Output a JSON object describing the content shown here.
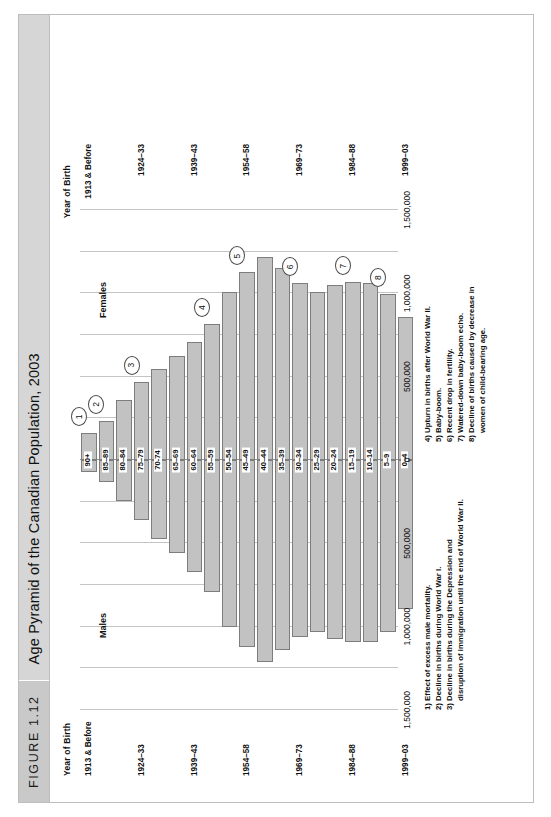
{
  "figure": {
    "number_label": "FIGURE 1.12",
    "title": "Age Pyramid of the Canadian Population, 2003",
    "year_of_birth_label_left": "Year of Birth",
    "year_of_birth_label_right": "Year of Birth",
    "males_caption": "Males",
    "females_caption": "Females",
    "source": "Source: Based on data in Statistics Canada, CANSIM Table 051-0001 and the periodization in Catalogue 91-209-XPE."
  },
  "axis": {
    "ticks_left": [
      "1,500,000",
      "1,000,000",
      "500,000",
      "0"
    ],
    "ticks_right": [
      "500,000",
      "1,000,000",
      "1,500,000"
    ],
    "all_ticks": [
      "1,500,000",
      "1,000,000",
      "500,000",
      "0",
      "500,000",
      "1,000,000",
      "1,500,000"
    ]
  },
  "notes_left": [
    "1) Effect of excess male mortality.",
    "2) Decline in births during World War I.",
    "3) Decline in births during the Depression and",
    "disruption of immigration until the end of World War II."
  ],
  "notes_right": [
    "4) Upturn in births after World War II.",
    "5) Baby-boom.",
    "6) Recent drop in fertility.",
    "7) Watered-down baby-boom echo.",
    "8) Decline of births caused by decrease in",
    "women of child-bearing age."
  ],
  "callouts": [
    {
      "n": "1",
      "row": 0
    },
    {
      "n": "2",
      "row": 1
    },
    {
      "n": "3",
      "row": 3
    },
    {
      "n": "4",
      "row": 7
    },
    {
      "n": "5",
      "row": 9
    },
    {
      "n": "6",
      "row": 12
    },
    {
      "n": "7",
      "row": 15
    },
    {
      "n": "8",
      "row": 17
    }
  ],
  "colors": {
    "bar_fill": "#c2c2c2",
    "bar_stroke": "#7d7d7d",
    "grid": "#c4c4c4",
    "axis": "#8e8e8e",
    "title_bar": "#d6d6d6",
    "fig_num_bar": "#c9c9c9"
  },
  "chart_data": {
    "type": "bar",
    "title": "Age Pyramid of the Canadian Population, 2003",
    "subtype": "population-pyramid",
    "xlabel": "",
    "ylabel": "Year of Birth",
    "xlim": [
      -1500000,
      1500000
    ],
    "grid": true,
    "legend": [
      "Males",
      "Females"
    ],
    "legend_position": "inside-top",
    "categories": [
      "90+",
      "85–89",
      "80–84",
      "75–79",
      "70-74",
      "65–69",
      "60–64",
      "55–59",
      "50–54",
      "45–49",
      "40–44",
      "35–39",
      "30–34",
      "25–29",
      "20–24",
      "15–19",
      "10–14",
      "5–9",
      "0–4"
    ],
    "year_of_birth": [
      "1913 & Before",
      "",
      "",
      "1924–33",
      "",
      "",
      "1939–43",
      "",
      "",
      "1954–58",
      "",
      "",
      "1969–73",
      "",
      "",
      "1984–88",
      "",
      "",
      "1999–03"
    ],
    "series": [
      {
        "name": "Males",
        "values": [
          75000,
          135000,
          245000,
          360000,
          475000,
          560000,
          670000,
          790000,
          1000000,
          1120000,
          1210000,
          1140000,
          1060000,
          1030000,
          1075000,
          1090000,
          1090000,
          1035000,
          895000
        ]
      },
      {
        "name": "Females",
        "values": [
          160000,
          235000,
          360000,
          470000,
          545000,
          625000,
          710000,
          815000,
          1010000,
          1125000,
          1215000,
          1150000,
          1060000,
          1010000,
          1050000,
          1065000,
          1060000,
          995000,
          855000
        ]
      }
    ]
  }
}
